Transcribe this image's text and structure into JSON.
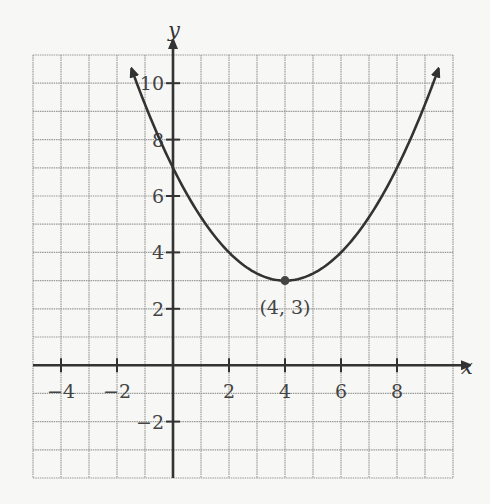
{
  "chart_data": {
    "type": "line",
    "title": "",
    "xlabel": "x",
    "ylabel": "y",
    "xlim": [
      -5,
      10
    ],
    "ylim": [
      -4,
      11
    ],
    "grid": true,
    "grid_step": 1,
    "x_ticks": [
      -4,
      -2,
      2,
      4,
      6,
      8
    ],
    "x_tick_labels": [
      "−4",
      "−2",
      "2",
      "4",
      "6",
      "8"
    ],
    "y_ticks": [
      -2,
      2,
      4,
      6,
      8,
      10
    ],
    "y_tick_labels": [
      "−2",
      "2",
      "4",
      "6",
      "8",
      "10"
    ],
    "series": [
      {
        "name": "parabola",
        "equation": "y = (x - 4)^2 / 4 + 3",
        "x": [
          -1.5,
          -1,
          0,
          1,
          2,
          3,
          4,
          5,
          6,
          7,
          8,
          9,
          9.5
        ],
        "y": [
          10.56,
          9.25,
          7,
          5.25,
          4,
          3.25,
          3,
          3.25,
          4,
          5.25,
          7,
          9.25,
          10.56
        ],
        "arrows_at_ends": true,
        "color": "#333333"
      }
    ],
    "annotations": [
      {
        "text": "(4, 3)",
        "x": 4,
        "y": 3,
        "point": true,
        "label_position": "below"
      }
    ]
  },
  "colors": {
    "background": "#f7f7f5",
    "grid": "#9a9a9a",
    "axis": "#333333",
    "curve": "#333333",
    "text": "#444444"
  }
}
